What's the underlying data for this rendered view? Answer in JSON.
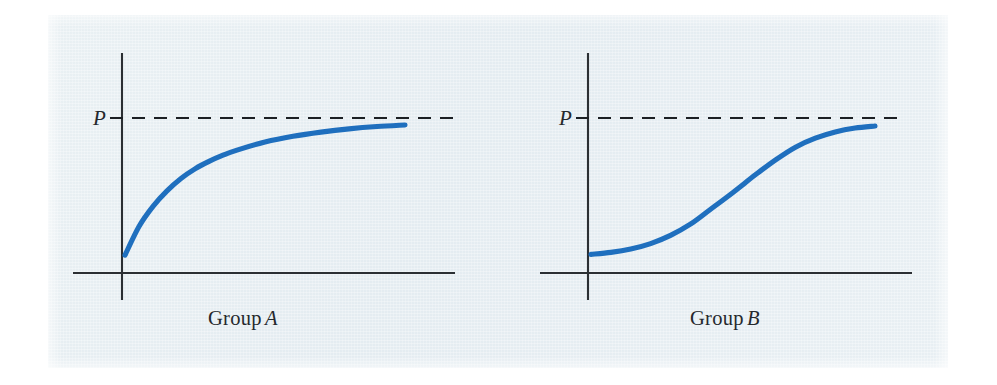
{
  "figure": {
    "background_color": "#ffffff",
    "plate_color": "#e7eef2",
    "curve_color": "#1f6fbe",
    "axis_color": "#2b2f33"
  },
  "chart_data": [
    {
      "type": "line",
      "title": "Group A",
      "title_prefix": "Group",
      "title_symbol": "A",
      "xlabel": "",
      "ylabel": "",
      "yaxis_tick_labels": [
        "P"
      ],
      "annotations": [
        {
          "text": "P",
          "kind": "y-axis-asymptote-label",
          "value": "P"
        },
        {
          "text": "Group A",
          "kind": "panel-caption"
        }
      ],
      "asymptote": {
        "label": "P",
        "y": 1.0,
        "style": "dashed"
      },
      "grid": false,
      "legend": null,
      "shape": "negatively-accelerated / concave-down learning curve",
      "x": [
        0.0,
        0.05,
        0.1,
        0.15,
        0.2,
        0.25,
        0.3,
        0.35,
        0.4,
        0.5,
        0.6,
        0.7,
        0.8,
        0.9,
        1.0
      ],
      "values": [
        0.115,
        0.3,
        0.43,
        0.53,
        0.61,
        0.672,
        0.72,
        0.76,
        0.793,
        0.845,
        0.882,
        0.909,
        0.93,
        0.945,
        0.955
      ],
      "xlim": [
        0,
        1
      ],
      "ylim": [
        0,
        1.07
      ]
    },
    {
      "type": "line",
      "title": "Group B",
      "title_prefix": "Group",
      "title_symbol": "B",
      "xlabel": "",
      "ylabel": "",
      "yaxis_tick_labels": [
        "P"
      ],
      "annotations": [
        {
          "text": "P",
          "kind": "y-axis-asymptote-label",
          "value": "P"
        },
        {
          "text": "Group B",
          "kind": "panel-caption"
        }
      ],
      "asymptote": {
        "label": "P",
        "y": 1.0,
        "style": "dashed"
      },
      "grid": false,
      "legend": null,
      "shape": "S-shaped / ogival (sigmoid) learning curve",
      "x": [
        0.0,
        0.07,
        0.14,
        0.21,
        0.28,
        0.35,
        0.42,
        0.5,
        0.58,
        0.65,
        0.72,
        0.79,
        0.86,
        0.93,
        1.0
      ],
      "values": [
        0.12,
        0.133,
        0.155,
        0.19,
        0.243,
        0.315,
        0.41,
        0.52,
        0.635,
        0.73,
        0.812,
        0.87,
        0.91,
        0.935,
        0.948
      ],
      "xlim": [
        0,
        1
      ],
      "ylim": [
        0,
        1.07
      ]
    }
  ],
  "panel_a": {
    "caption_prefix": "Group",
    "caption_symbol": "A",
    "p_label": "P"
  },
  "panel_b": {
    "caption_prefix": "Group",
    "caption_symbol": "B",
    "p_label": "P"
  }
}
